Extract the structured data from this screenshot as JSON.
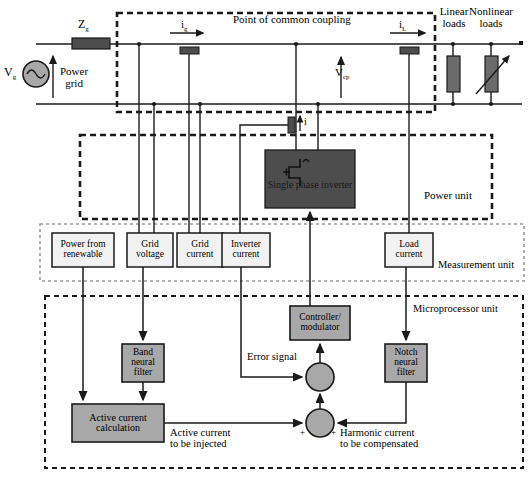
{
  "diagram": {
    "colors": {
      "line": "#1a1a1a",
      "dark_fill": "#4d4d4d",
      "mid_fill": "#a8a8a8",
      "light_fill": "#e9e9e9",
      "white_fill": "#ffffff",
      "dash_border": "#1a1a1a",
      "dotted_border": "#9a9a9a"
    }
  },
  "power_circuit": {
    "source_label": "V",
    "source_sub": "g",
    "impedance_label": "Z",
    "impedance_sub": "g",
    "grid_label_line1": "Power",
    "grid_label_line2": "grid",
    "pcc_label": "Point of common coupling",
    "grid_current_label": "i",
    "grid_current_sub": "g",
    "load_current_label": "i",
    "load_current_sub": "L",
    "pcc_voltage_label": "V",
    "pcc_voltage_sub": "cp",
    "inverter_current_label": "i",
    "linear_load_line1": "Linear",
    "linear_load_line2": "loads",
    "nonlinear_load_line1": "Nonlinear",
    "nonlinear_load_line2": "loads"
  },
  "power_unit": {
    "unit_label": "Power unit",
    "inverter_label": "Single phase inverter"
  },
  "measurement_unit": {
    "unit_label": "Measurement unit",
    "blocks": [
      {
        "line1": "Power from",
        "line2": "renewable"
      },
      {
        "line1": "Grid",
        "line2": "voltage"
      },
      {
        "line1": "Grid",
        "line2": "current"
      },
      {
        "line1": "Inverter",
        "line2": "current"
      },
      {
        "line1": "Load",
        "line2": "current"
      }
    ]
  },
  "microprocessor_unit": {
    "unit_label": "Microprocessor unit",
    "controller_line1": "Controller/",
    "controller_line2": "modulator",
    "band_filter_line1": "Band",
    "band_filter_line2": "neural",
    "band_filter_line3": "filter",
    "notch_filter_line1": "Notch",
    "notch_filter_line2": "neural",
    "notch_filter_line3": "filter",
    "active_calc_line1": "Active current",
    "active_calc_line2": "calculation",
    "error_signal_label": "Error signal",
    "active_current_line1": "Active current",
    "active_current_line2": "to be injected",
    "harmonic_current_line1": "Harmonic current",
    "harmonic_current_line2": "to be compensated",
    "sum_plus_left": "+",
    "sum_plus_right": "+"
  }
}
